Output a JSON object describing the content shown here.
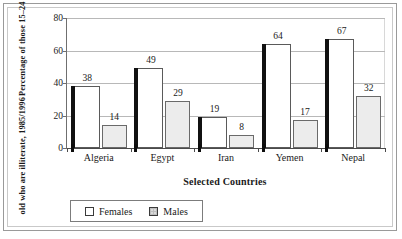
{
  "chart_data": {
    "type": "bar",
    "title": "",
    "xlabel": "Selected Countries",
    "ylabel_line1": "Percentage of those 15–24 years",
    "ylabel_line2": "old who are illiterate, 1985/1996",
    "categories": [
      "Algeria",
      "Egypt",
      "Iran",
      "Yemen",
      "Nepal"
    ],
    "series": [
      {
        "name": "Females",
        "values": [
          38,
          49,
          19,
          64,
          67
        ]
      },
      {
        "name": "Males",
        "values": [
          14,
          29,
          8,
          17,
          32
        ]
      }
    ],
    "ylim": [
      0,
      80
    ],
    "yticks": [
      0,
      20,
      40,
      60,
      80
    ],
    "ytick_labels": [
      "0",
      "20",
      "40",
      "60",
      "80"
    ],
    "grid": true,
    "legend_position": "below-plot",
    "colors": {
      "females_fill": "#ffffff",
      "females_edge": "#5a5a5a",
      "females_shadow": "#111111",
      "males_fill": "#ececec",
      "males_edge": "#6a6a6a",
      "gridline": "#b8b8b8",
      "axis": "#4a4a4a"
    }
  },
  "legend": {
    "items": [
      {
        "label": "Females",
        "swatch": "white-square-swatch"
      },
      {
        "label": "Males",
        "swatch": "gray-square-swatch"
      }
    ]
  }
}
